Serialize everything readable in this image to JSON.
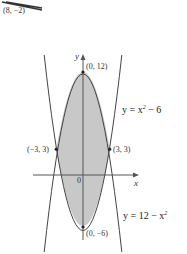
{
  "fragment_top": {
    "label": "(8, −2)"
  },
  "axes": {
    "y_label": "y",
    "x_label": "x",
    "origin_label": "0"
  },
  "points": {
    "top_vertex": "(0, 12)",
    "left_intersection": "(−3, 3)",
    "right_intersection": "(3, 3)",
    "bottom_vertex": "(0, −6)"
  },
  "curves": {
    "upper": {
      "eq_prefix": "y = x",
      "eq_sup": "2",
      "eq_suffix": " − 6"
    },
    "lower": {
      "eq_prefix": "y = 12 − x",
      "eq_sup": "2",
      "eq_suffix": ""
    }
  },
  "colors": {
    "fill": "#c8c8c8",
    "stroke": "#444444"
  }
}
